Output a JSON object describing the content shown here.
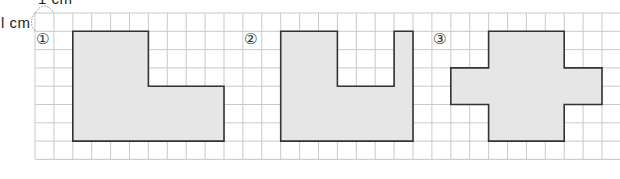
{
  "grid": {
    "origin_x": 35,
    "origin_y": 13,
    "cell_w": 18.9,
    "cell_h": 18.3,
    "cols": 31,
    "rows": 8,
    "line_color": "#c9c9c9",
    "shape_fill": "#e6e6e6",
    "shape_stroke": "#333333"
  },
  "unit": {
    "top_label": "1 cm",
    "left_label": "l cm"
  },
  "figures": [
    {
      "label": "①",
      "label_cell": [
        0,
        1
      ],
      "points": [
        [
          2,
          1
        ],
        [
          6,
          1
        ],
        [
          6,
          4
        ],
        [
          10,
          4
        ],
        [
          10,
          7
        ],
        [
          2,
          7
        ]
      ]
    },
    {
      "label": "②",
      "label_cell": [
        11,
        1
      ],
      "points": [
        [
          13,
          1
        ],
        [
          16,
          1
        ],
        [
          16,
          4
        ],
        [
          19,
          4
        ],
        [
          19,
          1
        ],
        [
          20,
          1
        ],
        [
          20,
          7
        ],
        [
          13,
          7
        ]
      ]
    },
    {
      "label": "③",
      "label_cell": [
        21,
        1
      ],
      "points": [
        [
          24,
          1
        ],
        [
          28,
          1
        ],
        [
          28,
          3
        ],
        [
          30,
          3
        ],
        [
          30,
          5
        ],
        [
          28,
          5
        ],
        [
          28,
          7
        ],
        [
          24,
          7
        ],
        [
          24,
          5
        ],
        [
          22,
          5
        ],
        [
          22,
          3
        ],
        [
          24,
          3
        ]
      ]
    }
  ]
}
